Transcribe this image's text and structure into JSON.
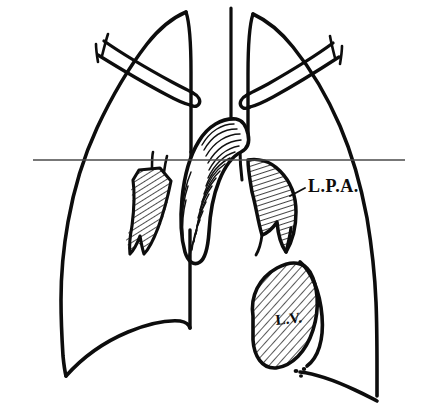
{
  "figure": {
    "background_color": "#ffffff",
    "ink_color": "#0d0d0d",
    "hatch_color": "#111111",
    "reference_line_color": "#4a4a4a",
    "width": 423,
    "height": 416
  },
  "labels": {
    "lpa": {
      "text": "L.P.A.",
      "meaning": "left pulmonary artery",
      "x": 308,
      "y": 192
    },
    "lv": {
      "text": "L.V.",
      "meaning": "left ventricle",
      "x": 276,
      "y": 325
    }
  },
  "structures": {
    "left_lung": "left lung field outline",
    "right_lung": "right lung field outline",
    "left_clavicle": "left clavicle",
    "right_clavicle": "right clavicle",
    "trachea": "tracheal air column",
    "aortic_arch": "aortic arch and pulmonary trunk shadow",
    "left_pulmonary_artery": "left pulmonary artery branch",
    "right_hilar_vessels": "right hilar vascular branches",
    "left_ventricle": "left ventricular border",
    "left_diaphragm": "left hemidiaphragm",
    "right_diaphragm": "right hemidiaphragm",
    "reference_line": "horizontal reference level line",
    "apex_marks": "cardiac apex marker dots",
    "leader_line": "leader line from L.P.A. label"
  }
}
